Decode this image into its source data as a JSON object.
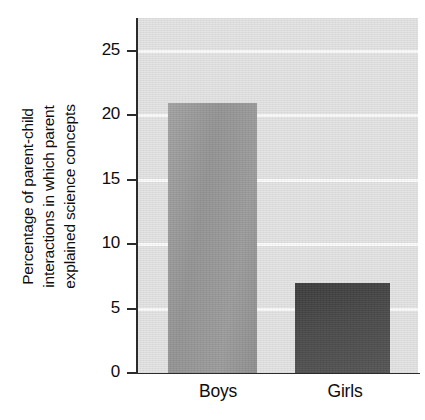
{
  "chart_data": {
    "type": "bar",
    "title": "",
    "subtitle": "",
    "categories": [
      "Boys",
      "Girls"
    ],
    "values": [
      21,
      7
    ],
    "series": [
      {
        "name": "Percentage of parent-child interactions in which parent explained science concepts",
        "values": [
          21,
          7
        ]
      }
    ],
    "xlabel": "",
    "ylabel": "Percentage of parent-child interactions in which parent explained science concepts",
    "ylabel_lines": [
      "Percentage of parent-child",
      "interactions in which parent",
      "explained science concepts"
    ],
    "ylim": [
      0,
      27.5
    ],
    "yticks": [
      0,
      5,
      10,
      15,
      20,
      25
    ],
    "ytick_labels": [
      "0",
      "5",
      "10",
      "15",
      "20",
      "25"
    ],
    "grid": true,
    "grid_orientation": "horizontal",
    "grid_color": "#fbfbfb",
    "legend": null,
    "legend_position": "none",
    "plot_background": "#e3e3e3",
    "bar_colors": [
      "#9a9a9a",
      "#4a4a4a"
    ],
    "axis_color": "#2b2b2b"
  },
  "axis": {
    "y_tick_0": "0",
    "y_tick_5": "5",
    "y_tick_10": "10",
    "y_tick_15": "15",
    "y_tick_20": "20",
    "y_tick_25": "25"
  },
  "labels": {
    "category_boys": "Boys",
    "category_girls": "Girls",
    "ylabel_line_1": "Percentage of parent-child",
    "ylabel_line_2": "interactions in which parent",
    "ylabel_line_3": "explained science concepts"
  }
}
